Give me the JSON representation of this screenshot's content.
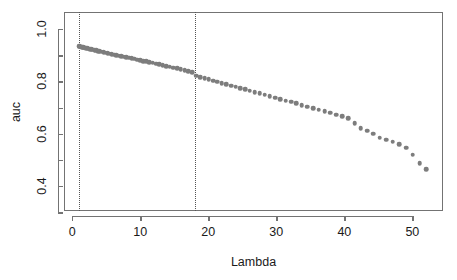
{
  "chart_data": {
    "type": "scatter",
    "title": "",
    "xlabel": "Lambda",
    "ylabel": "auc",
    "xlim": [
      -1.2,
      54.5
    ],
    "ylim": [
      0.305,
      1.065
    ],
    "grid": false,
    "legend": null,
    "point_color": "#7d7d7d",
    "axis_color": "#737373",
    "xticks": [
      0,
      10,
      20,
      30,
      40,
      50
    ],
    "xticklabels": [
      "0",
      "10",
      "20",
      "30",
      "40",
      "50"
    ],
    "yticks": [
      0.4,
      0.6,
      0.8,
      1.0
    ],
    "yticklabels": [
      "0.4",
      "0.6",
      "0.8",
      "1.0"
    ],
    "yminorticks": [
      0.3,
      0.5,
      0.7,
      0.9
    ],
    "annotations": [
      {
        "name": "lambda-min-line",
        "type": "vline",
        "x": 1,
        "style": "dotted",
        "color": "#555555"
      },
      {
        "name": "lambda-1se-line",
        "type": "vline",
        "x": 18,
        "style": "dotted",
        "color": "#555555"
      }
    ],
    "x": [
      1.0,
      1.1,
      1.21,
      1.33,
      1.46,
      1.6,
      1.75,
      1.91,
      2.08,
      2.26,
      2.45,
      2.65,
      2.86,
      3.08,
      3.31,
      3.55,
      3.8,
      4.06,
      4.33,
      4.61,
      4.9,
      5.2,
      5.51,
      5.83,
      6.16,
      6.5,
      6.85,
      7.21,
      7.58,
      7.96,
      8.35,
      8.75,
      9.16,
      9.58,
      10.01,
      10.45,
      10.9,
      11.36,
      11.83,
      12.31,
      12.8,
      13.3,
      13.81,
      14.33,
      14.86,
      15.4,
      15.95,
      16.51,
      17.08,
      17.66,
      18.25,
      18.85,
      19.46,
      20.08,
      20.71,
      21.35,
      22.0,
      22.66,
      23.33,
      24.01,
      24.7,
      25.4,
      26.11,
      26.83,
      27.56,
      28.3,
      29.05,
      29.81,
      30.58,
      31.36,
      32.15,
      32.95,
      33.76,
      34.58,
      35.41,
      36.25,
      37.1,
      37.96,
      38.83,
      39.71,
      40.6,
      41.5,
      42.41,
      43.33,
      44.26,
      45.2,
      46.15,
      47.11,
      48.08,
      49.06,
      50.05,
      51.05,
      52.06
    ],
    "y": [
      0.935,
      0.934,
      0.933,
      0.932,
      0.931,
      0.93,
      0.929,
      0.928,
      0.927,
      0.926,
      0.925,
      0.923,
      0.922,
      0.921,
      0.919,
      0.918,
      0.916,
      0.915,
      0.913,
      0.912,
      0.91,
      0.908,
      0.906,
      0.904,
      0.902,
      0.9,
      0.898,
      0.896,
      0.894,
      0.892,
      0.89,
      0.888,
      0.886,
      0.883,
      0.881,
      0.878,
      0.876,
      0.873,
      0.871,
      0.868,
      0.865,
      0.862,
      0.859,
      0.856,
      0.853,
      0.85,
      0.847,
      0.843,
      0.84,
      0.836,
      0.821,
      0.817,
      0.812,
      0.808,
      0.803,
      0.799,
      0.794,
      0.789,
      0.784,
      0.78,
      0.775,
      0.77,
      0.765,
      0.759,
      0.754,
      0.749,
      0.744,
      0.738,
      0.733,
      0.727,
      0.722,
      0.716,
      0.71,
      0.704,
      0.698,
      0.692,
      0.686,
      0.68,
      0.673,
      0.667,
      0.66,
      0.64,
      0.622,
      0.612,
      0.6,
      0.585,
      0.578,
      0.57,
      0.56,
      0.546,
      0.52,
      0.487,
      0.465
    ]
  }
}
